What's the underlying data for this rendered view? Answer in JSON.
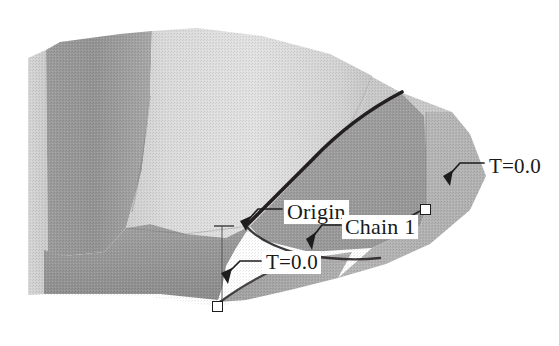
{
  "view": {
    "title": "3D surface patch with chain annotations",
    "background_color": "#ffffff",
    "render_style": "grayscale shaded surface, scanned halftone"
  },
  "palette": {
    "highlight": "#e0e0e0",
    "light": "#d2d2d2",
    "mid_light": "#c2c2c2",
    "mid": "#b2b2b2",
    "mid_dark": "#9e9e9e",
    "dark": "#8f8f8f",
    "darker": "#848484",
    "curve": "#231f20",
    "leader": "#1d1d1d",
    "label_bg": "#ffffff",
    "label_text": "#1a1a1a"
  },
  "annotations": [
    {
      "id": "t-top",
      "name": "temperature-top-right",
      "text": "T=0.0",
      "anchor_x": 449,
      "anchor_y": 182,
      "label_x": 487,
      "label_y": 155
    },
    {
      "id": "origin",
      "name": "origin-point",
      "text": "Origin",
      "anchor_x": 247,
      "anchor_y": 226,
      "label_x": 284,
      "label_y": 200
    },
    {
      "id": "chain",
      "name": "chain-one",
      "text": "Chain 1",
      "anchor_x": 313,
      "anchor_y": 250,
      "label_x": 342,
      "label_y": 215
    },
    {
      "id": "t-bot",
      "name": "temperature-lower-left",
      "text": "T=0.0",
      "anchor_x": 228,
      "anchor_y": 279,
      "label_x": 263,
      "label_y": 251
    }
  ],
  "handles": [
    {
      "name": "chain-endpoint-lower",
      "x": 218,
      "y": 307
    },
    {
      "name": "chain-endpoint-upper",
      "x": 426,
      "y": 210
    }
  ],
  "chain_curve": {
    "name": "chain-1-curve",
    "description": "thick dark boundary curve from upper ridge down to lower-left origin",
    "stroke": "#231f20",
    "width": 3.4
  }
}
